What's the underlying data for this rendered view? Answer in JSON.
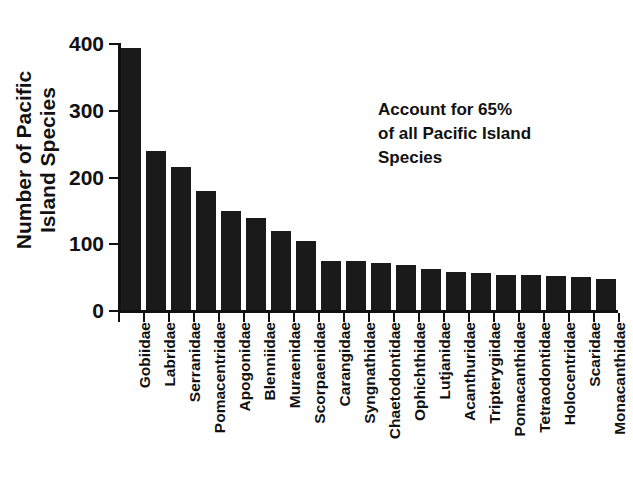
{
  "chart_data": {
    "type": "bar",
    "title": "",
    "xlabel": "",
    "ylabel": "Number of Pacific Island Species",
    "ylabel_lines": [
      "Number of Pacific",
      "Island Species"
    ],
    "ylim": [
      0,
      400
    ],
    "yticks": [
      0,
      100,
      200,
      300,
      400
    ],
    "ytick_labels": [
      "0",
      "100",
      "200",
      "300",
      "400"
    ],
    "grid": false,
    "legend": null,
    "bar_color": "#1a1a1a",
    "categories": [
      "Gobiidae",
      "Labridae",
      "Serranidae",
      "Pomacentridae",
      "Apogonidae",
      "Blenniidae",
      "Muraenidae",
      "Scorpaenidae",
      "Carangidae",
      "Syngnathidae",
      "Chaetodontidae",
      "Ophichthidae",
      "Lutjanidae",
      "Acanthuridae",
      "Tripterygiidae",
      "Pomacanthidae",
      "Tetraodontidae",
      "Holocentridae",
      "Scaridae",
      "Monacanthidae"
    ],
    "values": [
      393,
      238,
      214,
      179,
      149,
      138,
      118,
      103,
      74,
      74,
      70,
      67,
      61,
      57,
      55,
      53,
      52,
      51,
      50,
      47
    ],
    "annotations": [
      {
        "text": "Account for 65% of all Pacific Island Species",
        "lines": [
          "Account for 65%",
          "of all Pacific Island",
          "Species"
        ]
      }
    ]
  }
}
